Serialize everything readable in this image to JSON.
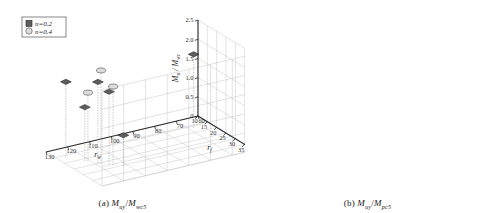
{
  "figure": {
    "panels": [
      {
        "id": "a",
        "caption_label": "(a)",
        "caption_num": "M",
        "caption_num_sub": "uy",
        "caption_den": "M",
        "caption_den_sub": "wc5",
        "y_axis_label": "M",
        "y_axis_label_sub": "u",
        "y_axis_label_den": "M",
        "y_axis_label_den_sub": "wc",
        "x_axis_label": "r",
        "x_axis_label_sub": "f",
        "z_axis_label": "r",
        "z_axis_label_sub": "w",
        "y_ticks": [
          "0",
          "0.5",
          "1.0",
          "1.5",
          "2.0",
          "2.5"
        ],
        "x_ticks": [
          "10",
          "15",
          "20",
          "25",
          "30",
          "35",
          "40"
        ],
        "z_ticks": [
          "130",
          "120",
          "110",
          "100",
          "90",
          "80",
          "70",
          "60"
        ]
      },
      {
        "id": "b",
        "caption_label": "(b)",
        "caption_num": "M",
        "caption_num_sub": "uy",
        "caption_den": "M",
        "caption_den_sub": "pc5",
        "y_axis_label": "M",
        "y_axis_label_sub": "u",
        "y_axis_label_den": "M",
        "y_axis_label_den_sub": "pc",
        "x_axis_label": "r",
        "x_axis_label_sub": "f",
        "z_axis_label": "r",
        "z_axis_label_sub": "w",
        "y_ticks": [
          "0",
          "0.3",
          "0.6",
          "0.9",
          "1.2",
          "1.5"
        ],
        "x_ticks": [
          "10",
          "15",
          "20",
          "25",
          "30",
          "35",
          "40"
        ],
        "z_ticks": [
          "130",
          "120",
          "110",
          "100",
          "90",
          "80",
          "70",
          "60"
        ]
      }
    ],
    "legend": {
      "entries": [
        {
          "marker": "dark-square",
          "label": "n=0.2"
        },
        {
          "marker": "light-circle",
          "label": "n=0.4"
        }
      ]
    },
    "colors": {
      "marker_dark": "#5e5e5e",
      "marker_dark_edge": "#252525",
      "marker_light": "#dcdcdc",
      "marker_light_edge": "#4a4a4a",
      "grid": "#c6c6c6",
      "axis": "#2b2b2b",
      "background": "#ffffff"
    }
  },
  "chart_data": [
    {
      "type": "scatter",
      "title": "(a) Muy / Mwc5",
      "projection": "3d",
      "xlabel": "r_f",
      "ylabel": "M_u / M_wc",
      "zlabel": "r_w",
      "xlim": [
        10,
        40
      ],
      "ylim": [
        0,
        2.5
      ],
      "zlim": [
        60,
        130
      ],
      "grid": true,
      "legend_position": "top-left",
      "series": [
        {
          "name": "n=0.2",
          "marker": "dark-square",
          "points": [
            {
              "rf": 16.0,
              "rw": 126.0,
              "ratio": 1.95
            },
            {
              "rf": 21.5,
              "rw": 122.0,
              "ratio": 1.4
            },
            {
              "rf": 25.0,
              "rw": 119.0,
              "ratio": 2.12
            },
            {
              "rf": 27.5,
              "rw": 116.0,
              "ratio": 1.9
            },
            {
              "rf": 30.5,
              "rw": 112.0,
              "ratio": 0.8
            },
            {
              "rf": 17.0,
              "rw": 68.0,
              "ratio": 1.92
            }
          ]
        },
        {
          "name": "n=0.4",
          "marker": "light-circle",
          "points": [
            {
              "rf": 22.0,
              "rw": 121.0,
              "ratio": 1.78
            },
            {
              "rf": 25.5,
              "rw": 118.0,
              "ratio": 2.42
            },
            {
              "rf": 28.5,
              "rw": 115.0,
              "ratio": 2.05
            }
          ]
        }
      ]
    },
    {
      "type": "scatter",
      "title": "(b) Muy / Mpc5",
      "projection": "3d",
      "xlabel": "r_f",
      "ylabel": "M_u / M_pc",
      "zlabel": "r_w",
      "xlim": [
        10,
        40
      ],
      "ylim": [
        0,
        1.5
      ],
      "zlim": [
        60,
        130
      ],
      "grid": true,
      "legend_position": "top-left",
      "series": [
        {
          "name": "n=0.2",
          "marker": "dark-square",
          "points": [
            {
              "rf": 16.0,
              "rw": 126.0,
              "ratio": 1.02
            },
            {
              "rf": 21.5,
              "rw": 122.0,
              "ratio": 0.68
            },
            {
              "rf": 25.0,
              "rw": 119.0,
              "ratio": 1.2
            },
            {
              "rf": 27.5,
              "rw": 116.0,
              "ratio": 1.03
            },
            {
              "rf": 30.5,
              "rw": 112.0,
              "ratio": 0.5
            },
            {
              "rf": 17.0,
              "rw": 68.0,
              "ratio": 1.12
            }
          ]
        },
        {
          "name": "n=0.4",
          "marker": "light-circle",
          "points": [
            {
              "rf": 27.8,
              "rw": 115.5,
              "ratio": 0.88
            }
          ]
        }
      ]
    }
  ]
}
